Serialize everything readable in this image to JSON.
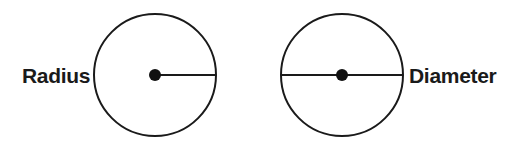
{
  "diagram": {
    "title": "",
    "colors": {
      "stroke": "#1a1a1a",
      "background": "#ffffff"
    },
    "figures": [
      {
        "id": "radius",
        "label": "Radius",
        "circle": {
          "cx": 155,
          "cy": 75,
          "r": 61
        },
        "center_dot": {
          "r": 6
        },
        "segment": {
          "x1": 155,
          "y1": 75,
          "x2": 216,
          "y2": 75
        },
        "label_position": {
          "x": 22,
          "y": 83,
          "anchor": "start"
        }
      },
      {
        "id": "diameter",
        "label": "Diameter",
        "circle": {
          "cx": 342,
          "cy": 75,
          "r": 61
        },
        "center_dot": {
          "r": 6
        },
        "segment": {
          "x1": 281,
          "y1": 75,
          "x2": 403,
          "y2": 75
        },
        "label_position": {
          "x": 409,
          "y": 83,
          "anchor": "start"
        }
      }
    ]
  }
}
